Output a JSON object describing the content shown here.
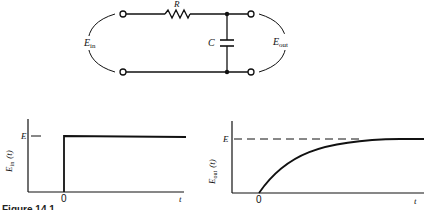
{
  "circuit": {
    "resistor_label": "R",
    "capacitor_label": "C",
    "input_label": "E",
    "input_sub": "in",
    "output_label": "E",
    "output_sub": "out"
  },
  "plots": {
    "input": {
      "ylabel": "E",
      "ylabel_sub": "in",
      "ylabel_arg": "(t)",
      "ytick": "E",
      "xtick": "0",
      "xlabel": "t"
    },
    "output": {
      "ylabel": "E",
      "ylabel_sub": "out",
      "ylabel_arg": "(t)",
      "ytick": "E",
      "xtick": "0",
      "xlabel": "t"
    }
  },
  "caption": "Figure 14.1"
}
